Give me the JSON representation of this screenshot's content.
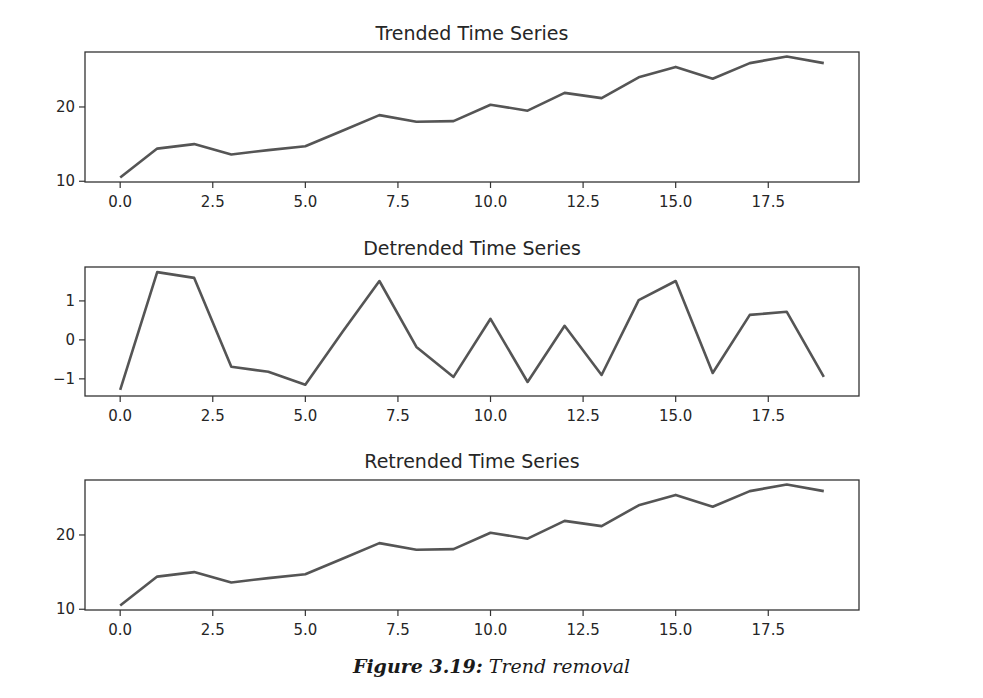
{
  "figure": {
    "caption_label": "Figure 3.19:",
    "caption_text": " Trend removal",
    "line_color": "#555555",
    "axis_color": "#333333"
  },
  "chart_data": [
    {
      "type": "line",
      "title": "Trended Time Series",
      "xlabel": "",
      "ylabel": "",
      "x": [
        0,
        1,
        2,
        3,
        4,
        5,
        6,
        7,
        8,
        9,
        10,
        11,
        12,
        13,
        14,
        15,
        16,
        17,
        18,
        19
      ],
      "values": [
        10.5,
        14.4,
        15.0,
        13.6,
        14.2,
        14.7,
        16.8,
        18.9,
        18.0,
        18.1,
        20.3,
        19.5,
        21.9,
        21.2,
        24.0,
        25.4,
        23.8,
        25.9,
        26.8,
        25.9
      ],
      "xticks": [
        "0.0",
        "2.5",
        "5.0",
        "7.5",
        "10.0",
        "12.5",
        "15.0",
        "17.5"
      ],
      "xtick_values": [
        0,
        2.5,
        5,
        7.5,
        10,
        12.5,
        15,
        17.5
      ],
      "yticks": [
        "10",
        "20"
      ],
      "ytick_values": [
        10,
        20
      ],
      "xlim": [
        -0.95,
        19.95
      ],
      "ylim": [
        9.9,
        27.4
      ],
      "grid": false,
      "legend": null
    },
    {
      "type": "line",
      "title": "Detrended Time Series",
      "xlabel": "",
      "ylabel": "",
      "x": [
        0,
        1,
        2,
        3,
        4,
        5,
        6,
        7,
        8,
        9,
        10,
        11,
        12,
        13,
        14,
        15,
        16,
        17,
        18,
        19
      ],
      "values": [
        -1.28,
        1.74,
        1.59,
        -0.69,
        -0.82,
        -1.15,
        0.2,
        1.51,
        -0.18,
        -0.95,
        0.54,
        -1.08,
        0.36,
        -0.9,
        1.02,
        1.51,
        -0.85,
        0.64,
        0.72,
        -0.95
      ],
      "xticks": [
        "0.0",
        "2.5",
        "5.0",
        "7.5",
        "10.0",
        "12.5",
        "15.0",
        "17.5"
      ],
      "xtick_values": [
        0,
        2.5,
        5,
        7.5,
        10,
        12.5,
        15,
        17.5
      ],
      "yticks": [
        "−1",
        "0",
        "1"
      ],
      "ytick_values": [
        -1,
        0,
        1
      ],
      "xlim": [
        -0.95,
        19.95
      ],
      "ylim": [
        -1.44,
        1.87
      ],
      "grid": false,
      "legend": null
    },
    {
      "type": "line",
      "title": "Retrended Time Series",
      "xlabel": "",
      "ylabel": "",
      "x": [
        0,
        1,
        2,
        3,
        4,
        5,
        6,
        7,
        8,
        9,
        10,
        11,
        12,
        13,
        14,
        15,
        16,
        17,
        18,
        19
      ],
      "values": [
        10.5,
        14.4,
        15.0,
        13.6,
        14.2,
        14.7,
        16.8,
        18.9,
        18.0,
        18.1,
        20.3,
        19.5,
        21.9,
        21.2,
        24.0,
        25.4,
        23.8,
        25.9,
        26.8,
        25.9
      ],
      "xticks": [
        "0.0",
        "2.5",
        "5.0",
        "7.5",
        "10.0",
        "12.5",
        "15.0",
        "17.5"
      ],
      "xtick_values": [
        0,
        2.5,
        5,
        7.5,
        10,
        12.5,
        15,
        17.5
      ],
      "yticks": [
        "10",
        "20"
      ],
      "ytick_values": [
        10,
        20
      ],
      "xlim": [
        -0.95,
        19.95
      ],
      "ylim": [
        9.9,
        27.4
      ],
      "grid": false,
      "legend": null
    }
  ],
  "layout": {
    "panels": [
      {
        "left": 85,
        "top": 52,
        "width": 774,
        "height": 130
      },
      {
        "left": 85,
        "top": 267,
        "width": 774,
        "height": 129
      },
      {
        "left": 85,
        "top": 480,
        "width": 774,
        "height": 130
      }
    ]
  }
}
